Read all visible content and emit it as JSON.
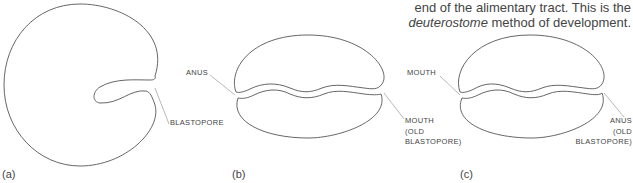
{
  "caption": {
    "line1": "end of the alimentary tract. This is the",
    "line2_italic": "deuterostome",
    "line2_rest": " method of development."
  },
  "panels": {
    "a": {
      "label": "(a)",
      "annotations": [
        {
          "text": "BLASTOPORE"
        }
      ]
    },
    "b": {
      "label": "(b)",
      "annotations": [
        {
          "text": "ANUS"
        },
        {
          "line1": "MOUTH",
          "line2": "(OLD",
          "line3": "BLASTOPORE)"
        }
      ]
    },
    "c": {
      "label": "(c)",
      "annotations": [
        {
          "text": "MOUTH"
        },
        {
          "line1": "ANUS",
          "line2": "(OLD",
          "line3": "BLASTOPORE)"
        }
      ]
    }
  },
  "colors": {
    "stroke": "#555555",
    "leader": "#888888",
    "text": "#444444"
  }
}
